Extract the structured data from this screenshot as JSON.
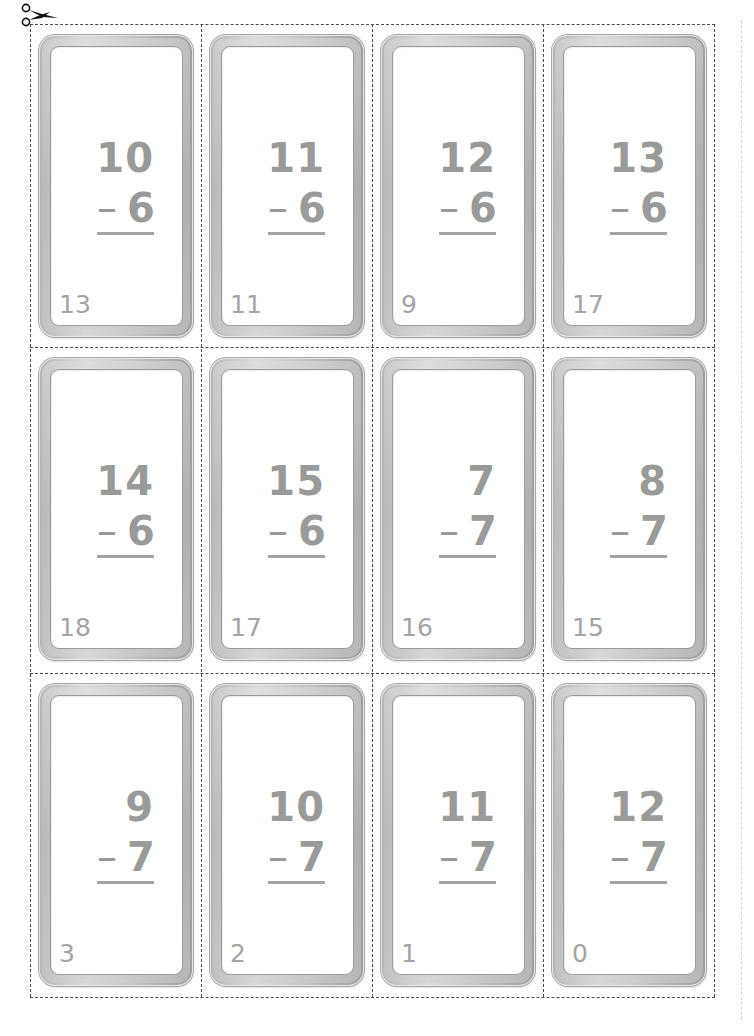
{
  "sheet": {
    "title": "Subtraction flash cards",
    "cut_icon": "scissors-icon",
    "colors": {
      "text": "#9a9a9a",
      "frame": "#c0c0c0",
      "cut_line": "#4a4a4a"
    },
    "cards": [
      {
        "top": "10",
        "bottom": "6",
        "operator": "–",
        "answer": "13"
      },
      {
        "top": "11",
        "bottom": "6",
        "operator": "–",
        "answer": "11"
      },
      {
        "top": "12",
        "bottom": "6",
        "operator": "–",
        "answer": "9"
      },
      {
        "top": "13",
        "bottom": "6",
        "operator": "–",
        "answer": "17"
      },
      {
        "top": "14",
        "bottom": "6",
        "operator": "–",
        "answer": "18"
      },
      {
        "top": "15",
        "bottom": "6",
        "operator": "–",
        "answer": "17"
      },
      {
        "top": "7",
        "bottom": "7",
        "operator": "–",
        "answer": "16"
      },
      {
        "top": "8",
        "bottom": "7",
        "operator": "–",
        "answer": "15"
      },
      {
        "top": "9",
        "bottom": "7",
        "operator": "–",
        "answer": "3"
      },
      {
        "top": "10",
        "bottom": "7",
        "operator": "–",
        "answer": "2"
      },
      {
        "top": "11",
        "bottom": "7",
        "operator": "–",
        "answer": "1"
      },
      {
        "top": "12",
        "bottom": "7",
        "operator": "–",
        "answer": "0"
      }
    ]
  }
}
